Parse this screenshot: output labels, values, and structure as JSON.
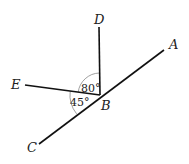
{
  "diagram": {
    "type": "angle-geometry",
    "points": {
      "A": {
        "label": "A",
        "x": 164,
        "y": 50
      },
      "B": {
        "label": "B",
        "x": 100,
        "y": 95
      },
      "C": {
        "label": "C",
        "x": 39,
        "y": 144
      },
      "D": {
        "label": "D",
        "x": 99,
        "y": 27
      },
      "E": {
        "label": "E",
        "x": 25,
        "y": 85
      }
    },
    "segments": [
      {
        "from": "A",
        "to": "C",
        "name": "line-AC"
      },
      {
        "from": "B",
        "to": "D",
        "name": "ray-BD"
      },
      {
        "from": "B",
        "to": "E",
        "name": "ray-BE"
      }
    ],
    "angles": [
      {
        "name": "angle-DBE",
        "label": "80°",
        "between": [
          "D",
          "E"
        ]
      },
      {
        "name": "angle-EBC",
        "label": "45°",
        "between": [
          "E",
          "C"
        ]
      }
    ]
  }
}
